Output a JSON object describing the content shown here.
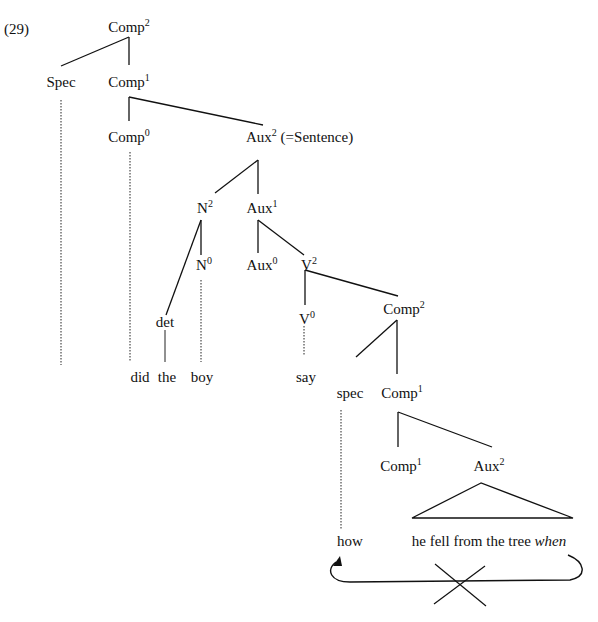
{
  "example_number": "(29)",
  "nodes": {
    "root_comp2": {
      "base": "Comp",
      "sup": "2"
    },
    "spec_top": {
      "base": "Spec"
    },
    "comp1_top": {
      "base": "Comp",
      "sup": "1"
    },
    "comp0": {
      "base": "Comp",
      "sup": "0"
    },
    "aux2": {
      "base": "Aux",
      "sup": "2",
      "note": " (=Sentence)"
    },
    "n2": {
      "base": "N",
      "sup": "2"
    },
    "aux1": {
      "base": "Aux",
      "sup": "1"
    },
    "n0": {
      "base": "N",
      "sup": "0"
    },
    "aux0": {
      "base": "Aux",
      "sup": "0"
    },
    "v2": {
      "base": "V",
      "sup": "2"
    },
    "det": {
      "base": "det"
    },
    "v0": {
      "base": "V",
      "sup": "0"
    },
    "comp2_low": {
      "base": "Comp",
      "sup": "2"
    },
    "spec_low": {
      "base": "spec"
    },
    "comp1_low": {
      "base": "Comp",
      "sup": "1"
    },
    "comp1_lower": {
      "base": "Comp",
      "sup": "1"
    },
    "aux2_low": {
      "base": "Aux",
      "sup": "2"
    }
  },
  "words": {
    "did": "did",
    "the": "the",
    "boy": "boy",
    "say": "say",
    "how": "how",
    "embedded_clause": "he fell from the tree ",
    "embedded_wh": "when"
  },
  "annotations": {
    "movement_arrow": "blocked movement arrow from 'when' to 'how' position",
    "blocked_mark": "X"
  },
  "colors": {
    "ink": "#111111",
    "background": "#ffffff"
  }
}
